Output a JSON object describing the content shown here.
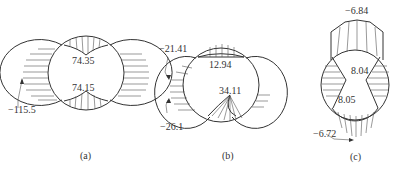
{
  "figure": {
    "panels": [
      {
        "id": "a",
        "caption": "(a)",
        "labels": {
          "top": "74.35",
          "bottom": "74.15",
          "left": "−115.5"
        }
      },
      {
        "id": "b",
        "caption": "(b)",
        "labels": {
          "top": "12.94",
          "bottom": "34.11",
          "left_upper": "−21.41",
          "left_lower": "−26.1"
        }
      },
      {
        "id": "c",
        "caption": "(c)",
        "labels": {
          "top": "−6.84",
          "middle_upper": "8.04",
          "middle_lower": "8.05",
          "bottom_left": "−6.72"
        }
      }
    ]
  }
}
